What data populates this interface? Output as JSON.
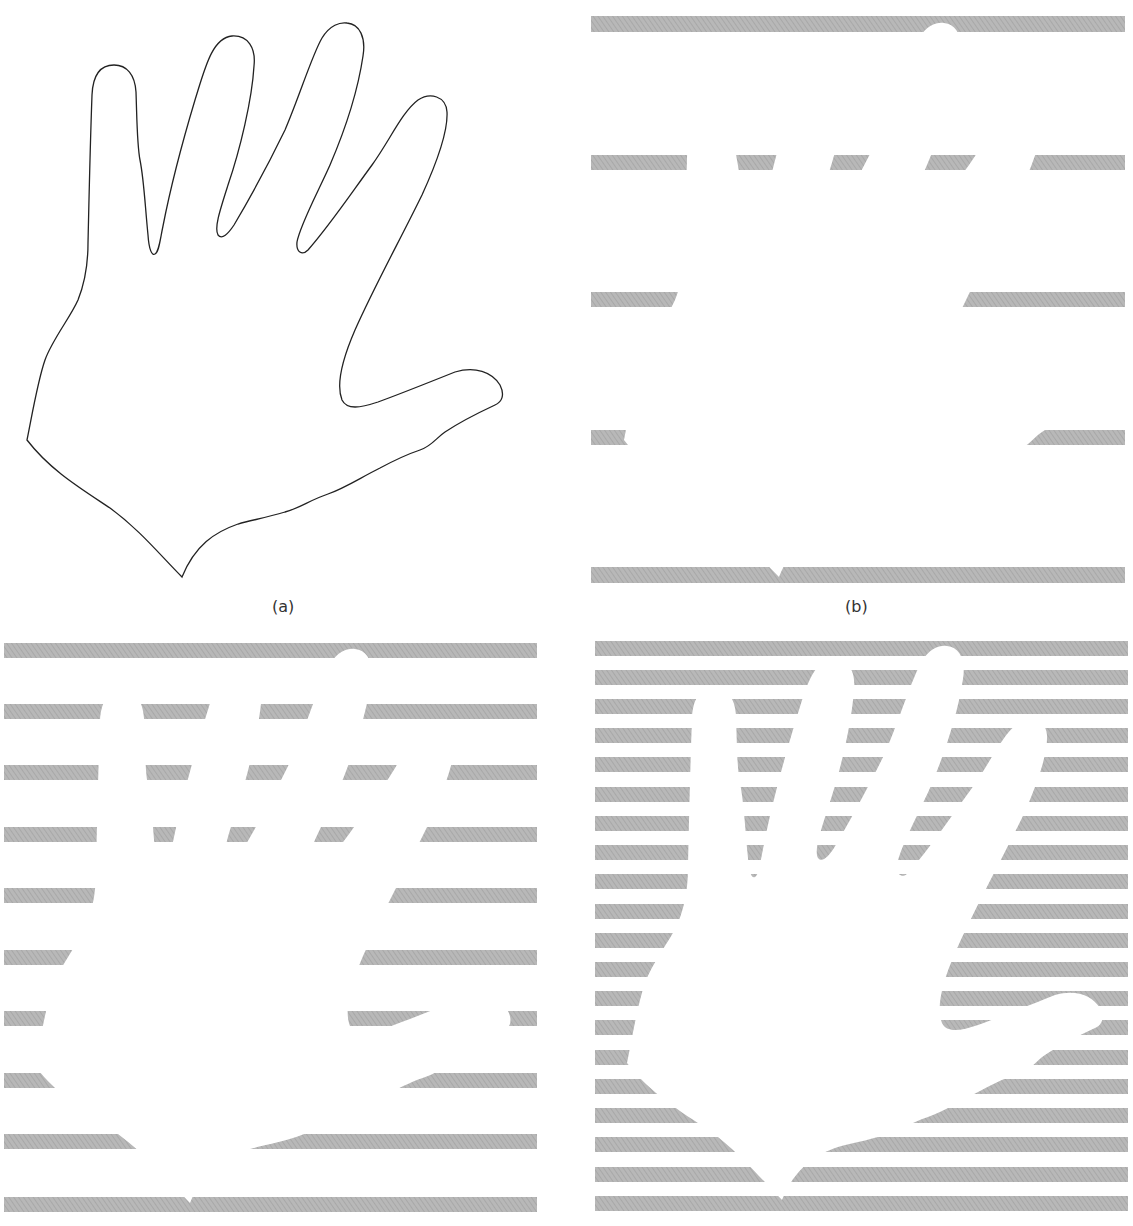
{
  "figure": {
    "stripe_color": "#b6b6b6",
    "stripe_hatch_color": "#9c9c9c",
    "outline_color": "#222222",
    "background": "#ffffff"
  },
  "panels": [
    {
      "id": "a",
      "label": "(a)",
      "content": "hand outline"
    },
    {
      "id": "b",
      "label": "(b)",
      "content": "hand sampled with 5 horizontal stripes"
    },
    {
      "id": "c",
      "label": "",
      "content": "hand sampled with 10 horizontal stripes"
    },
    {
      "id": "d",
      "label": "",
      "content": "hand sampled with 20 horizontal stripes"
    }
  ]
}
